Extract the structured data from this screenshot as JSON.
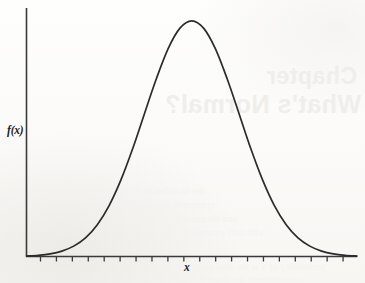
{
  "figure": {
    "kind": "normal-distribution-curve",
    "background_color": "#fdfdfc",
    "ink_color": "#2b2b2b"
  },
  "axes": {
    "y_label": "f(x)",
    "x_label": "x",
    "x_axis_color": "#3a3a3a",
    "y_axis_color": "#3a3a3a",
    "tick_count": 20,
    "ticks_show_labels": false
  },
  "showthrough": {
    "description": "faint mirrored text bleeding through from the reverse side of the scanned page",
    "heading_line_1": "Chapter",
    "heading_line_2": "What's Normal?",
    "body_line_1": "the distribution of values is",
    "body_line_2": "symmetric about the mean",
    "body_line_3": "and the curve is bell shaped",
    "body_line_4": "with tails extending",
    "body_line_5": "probability of x is the area under the",
    "body_line_6": "curve between the given limits"
  },
  "chart_data": {
    "type": "line",
    "title": "",
    "subtitle": "",
    "xlabel": "x",
    "ylabel": "f(x)",
    "legend": [],
    "grid": false,
    "annotations": [],
    "curve_name": "normal probability density function",
    "mean": 0,
    "std_dev": 1,
    "peak_value": 1.0,
    "xlim": [
      -3.5,
      3.5
    ],
    "ylim": [
      0,
      1.05
    ],
    "x": [
      -3.5,
      -3.25,
      -3.0,
      -2.75,
      -2.5,
      -2.25,
      -2.0,
      -1.75,
      -1.5,
      -1.25,
      -1.0,
      -0.75,
      -0.5,
      -0.25,
      0.0,
      0.25,
      0.5,
      0.75,
      1.0,
      1.25,
      1.5,
      1.75,
      2.0,
      2.25,
      2.5,
      2.75,
      3.0,
      3.25,
      3.5
    ],
    "y": [
      0.002,
      0.005,
      0.011,
      0.023,
      0.044,
      0.079,
      0.135,
      0.216,
      0.325,
      0.458,
      0.607,
      0.754,
      0.882,
      0.969,
      1.0,
      0.969,
      0.882,
      0.754,
      0.607,
      0.458,
      0.325,
      0.216,
      0.135,
      0.079,
      0.044,
      0.023,
      0.011,
      0.005,
      0.002
    ],
    "xticks": [
      -3.5,
      -3.15,
      -2.8,
      -2.45,
      -2.1,
      -1.75,
      -1.4,
      -1.05,
      -0.7,
      -0.35,
      0.0,
      0.35,
      0.7,
      1.05,
      1.4,
      1.75,
      2.1,
      2.45,
      2.8,
      3.15
    ],
    "xticklabels": [],
    "yticks": [],
    "yticklabels": []
  }
}
